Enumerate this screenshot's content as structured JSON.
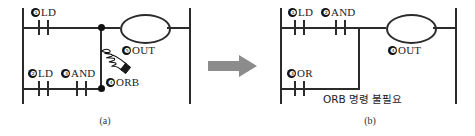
{
  "figure": {
    "colors": {
      "line": "#2b2b2b",
      "node": "#111111",
      "arrow": "#8c8c8c",
      "background": "#ffffff"
    }
  },
  "panel_a": {
    "caption": "(a)",
    "rungs": [
      {
        "row": "top",
        "elements": [
          {
            "marker": "❶",
            "label": "LD"
          }
        ]
      },
      {
        "row": "bottom",
        "elements": [
          {
            "marker": "❷",
            "label": "LD"
          },
          {
            "marker": "❸",
            "label": "AND"
          }
        ]
      }
    ],
    "orb": {
      "marker": "❹",
      "label": "ORB"
    },
    "coil": {
      "marker": "❺",
      "label": "OUT"
    },
    "pointer_icon": "pointing-hand-icon"
  },
  "panel_b": {
    "caption": "(b)",
    "rungs": [
      {
        "row": "top",
        "elements": [
          {
            "marker": "❶",
            "label": "LD"
          },
          {
            "marker": "❷",
            "label": "AND"
          }
        ]
      },
      {
        "row": "bottom",
        "elements": [
          {
            "marker": "❸",
            "label": "OR"
          }
        ]
      }
    ],
    "coil": {
      "marker": "❹",
      "label": "OUT"
    },
    "note": "ORB 명령 불필요"
  },
  "arrow": {
    "direction": "right",
    "name": "transition-arrow"
  }
}
